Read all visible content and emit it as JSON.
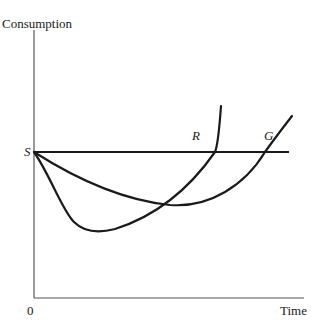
{
  "diagram": {
    "y_axis_label": "Consumption",
    "x_axis_label": "Time",
    "origin_label": "0",
    "s_label": "S",
    "r_label": "R",
    "g_label": "G",
    "line_color": "#1a1a1a"
  },
  "curves": [
    {
      "name": "S",
      "type": "horizontal-line",
      "description": "constant consumption level"
    },
    {
      "name": "R",
      "type": "u-curve",
      "description": "deep early dip, crosses S earlier"
    },
    {
      "name": "G",
      "type": "u-curve",
      "description": "shallow dip, crosses S later"
    }
  ]
}
